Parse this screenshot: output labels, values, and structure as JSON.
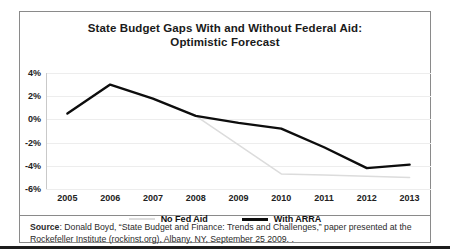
{
  "figure": {
    "title_line1": "State Budget Gaps With and Without Federal Aid:",
    "title_line2": "Optimistic Forecast",
    "source_label": "Source",
    "source_text": ": Donald Boyd, “State Budget and Finance: Trends and Challenges,” paper presented at the Rockefeller Institute (rockinst.org), Albany, NY, September 25 2009. ."
  },
  "colors": {
    "no_fed_aid": "#dcdcdc",
    "with_arra": "#0d0d0d",
    "gridline": "#ededed",
    "border": "#8a8a8a"
  },
  "chart_data": {
    "type": "line",
    "title": "State Budget Gaps With and Without Federal Aid: Optimistic Forecast",
    "xlabel": "",
    "ylabel": "",
    "ylim": [
      -6,
      4
    ],
    "yticks": [
      4,
      2,
      0,
      -2,
      -4,
      -6
    ],
    "ytick_labels": [
      "4%",
      "2%",
      "0%",
      "-2%",
      "-4%",
      "-6%"
    ],
    "grid": true,
    "legend_position": "bottom",
    "categories": [
      2005,
      2006,
      2007,
      2008,
      2009,
      2010,
      2011,
      2012,
      2013
    ],
    "tick_labels": [
      "2005",
      "2006",
      "2007",
      "2008",
      "2009",
      "2010",
      "2011",
      "2012",
      "2013"
    ],
    "series": [
      {
        "name": "No Fed Aid",
        "color": "#dcdcdc",
        "values": [
          null,
          null,
          null,
          0.3,
          -2.2,
          -4.7,
          -4.8,
          -4.9,
          -5.0
        ]
      },
      {
        "name": "With ARRA",
        "color": "#0d0d0d",
        "values": [
          0.5,
          3.0,
          1.8,
          0.3,
          -0.3,
          -0.8,
          -2.4,
          -4.2,
          -3.9
        ]
      }
    ]
  }
}
